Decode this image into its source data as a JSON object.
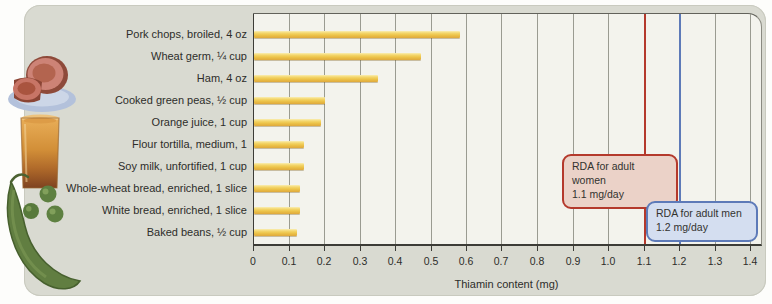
{
  "figure": {
    "panel_bg": "#d9dad1",
    "plot_bg": "#f3f3ed",
    "illustrations": [
      {
        "name": "ham-image",
        "depicts": "sliced ham on a blue plate"
      },
      {
        "name": "orange-juice-image",
        "depicts": "glass of orange juice"
      },
      {
        "name": "peas-image",
        "depicts": "pea pod with green peas"
      }
    ]
  },
  "chart_data": {
    "type": "bar",
    "orientation": "horizontal",
    "title": "",
    "xlabel": "Thiamin content (mg)",
    "ylabel": "",
    "categories": [
      "Pork chops, broiled, 4 oz",
      "Wheat germ, ¼ cup",
      "Ham, 4 oz",
      "Cooked green peas, ½ cup",
      "Orange juice, 1 cup",
      "Flour tortilla, medium, 1",
      "Soy milk, unfortified, 1 cup",
      "Whole-wheat bread, enriched, 1 slice",
      "White bread, enriched, 1 slice",
      "Baked beans, ½ cup"
    ],
    "values": [
      0.58,
      0.47,
      0.35,
      0.2,
      0.19,
      0.14,
      0.14,
      0.13,
      0.13,
      0.12
    ],
    "bar_color": "#ecc349",
    "xlim": [
      0,
      1.4
    ],
    "xticks": [
      0,
      0.1,
      0.2,
      0.3,
      0.4,
      0.5,
      0.6,
      0.7,
      0.8,
      0.9,
      1.0,
      1.1,
      1.2,
      1.3,
      1.4
    ],
    "xtick_labels": [
      "0",
      "0.1",
      "0.2",
      "0.3",
      "0.4",
      "0.5",
      "0.6",
      "0.7",
      "0.8",
      "0.9",
      "1.0",
      "1.1",
      "1.2",
      "1.3",
      "1.4"
    ],
    "gridlines": true,
    "reference_lines": [
      {
        "label": "RDA for adult women",
        "sublabel": "1.1 mg/day",
        "value": 1.1,
        "color": "#b4392c"
      },
      {
        "label": "RDA for adult men",
        "sublabel": "1.2 mg/day",
        "value": 1.2,
        "color": "#5d7ab8"
      }
    ]
  }
}
